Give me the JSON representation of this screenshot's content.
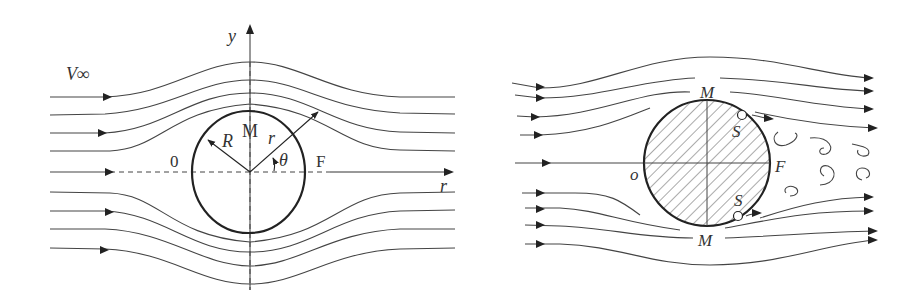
{
  "left_panel": {
    "title": "Ideal (potential) flow around a cylinder",
    "labels": {
      "freestream": "V∞",
      "y_axis": "y",
      "r_axis": "r",
      "front_point": "0",
      "top_point": "M",
      "rear_point": "F",
      "radius": "R",
      "radial_coord": "r",
      "angle": "θ"
    }
  },
  "right_panel": {
    "title": "Real (viscous) flow with separation and wake",
    "labels": {
      "front_point": "o",
      "top_point": "M",
      "bottom_point": "M",
      "rear_point": "F",
      "separation_top": "S",
      "separation_bottom": "S"
    }
  },
  "colors": {
    "line": "#444444",
    "outline": "#222222",
    "text": "#333333",
    "background": "#ffffff"
  }
}
